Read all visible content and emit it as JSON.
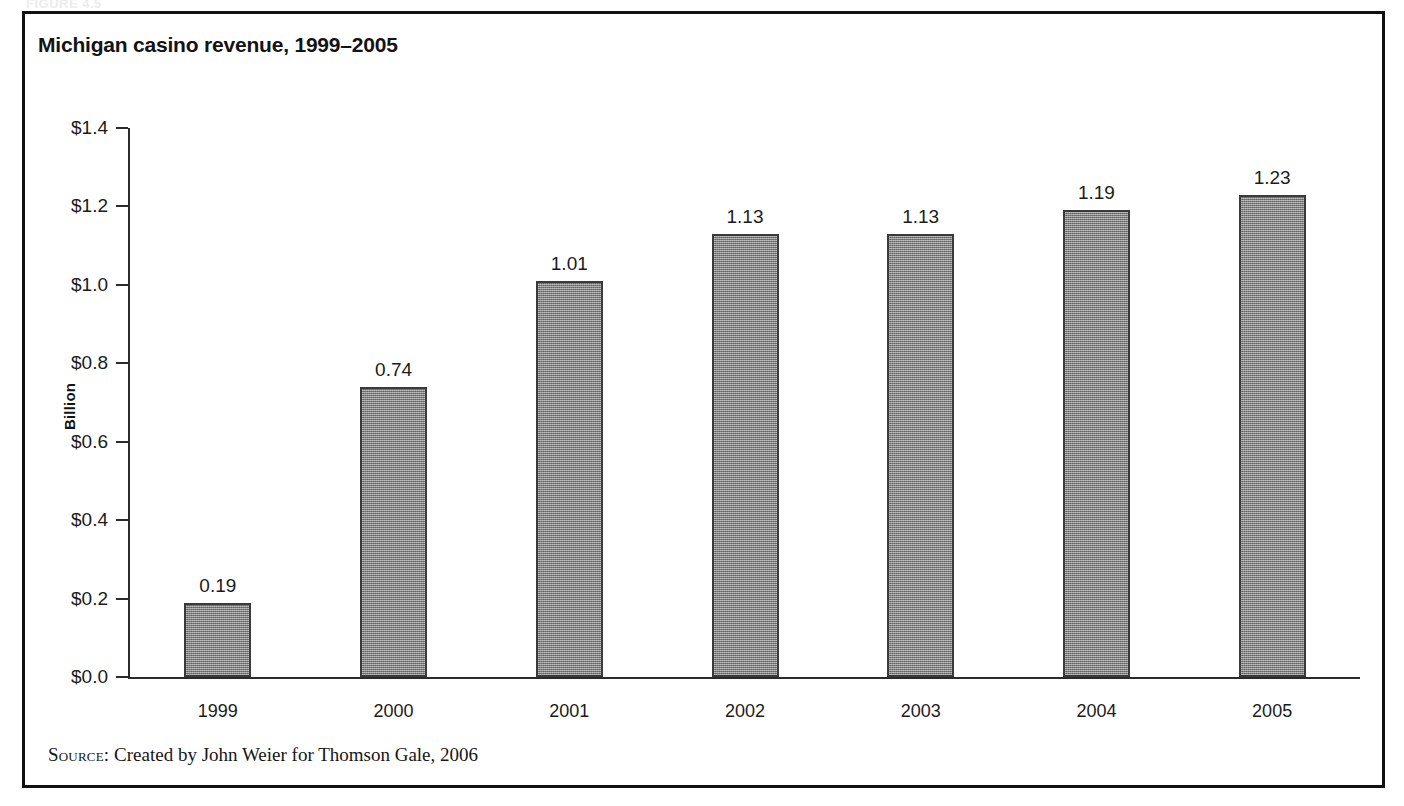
{
  "figure": {
    "caption_ghost": "FIGURE 4.5",
    "title": "Michigan casino revenue, 1999–2005",
    "source_label": "Source:",
    "source_text": "Created by John Weier for Thomson Gale, 2006",
    "border_color": "#111111",
    "bar_fill_color": "#8d8d8d",
    "bar_outline_color": "#3a3a3a",
    "axis_color": "#2b2b2b"
  },
  "chart_data": {
    "type": "bar",
    "title": "Michigan casino revenue, 1999–2005",
    "xlabel": "",
    "ylabel": "Billion",
    "categories": [
      "1999",
      "2000",
      "2001",
      "2002",
      "2003",
      "2004",
      "2005"
    ],
    "values": [
      0.19,
      0.74,
      1.01,
      1.13,
      1.13,
      1.19,
      1.23
    ],
    "value_labels": [
      "0.19",
      "0.74",
      "1.01",
      "1.13",
      "1.13",
      "1.19",
      "1.23"
    ],
    "ylim": [
      0.0,
      1.4
    ],
    "ytick_values": [
      0.0,
      0.2,
      0.4,
      0.6,
      0.8,
      1.0,
      1.2,
      1.4
    ],
    "ytick_labels": [
      "$0.0",
      "$0.2",
      "$0.4",
      "$0.6",
      "$0.8",
      "$1.0",
      "$1.2",
      "$1.4"
    ],
    "grid": false,
    "legend": null,
    "series": [
      {
        "name": "Casino revenue",
        "values": [
          0.19,
          0.74,
          1.01,
          1.13,
          1.13,
          1.19,
          1.23
        ]
      }
    ]
  }
}
